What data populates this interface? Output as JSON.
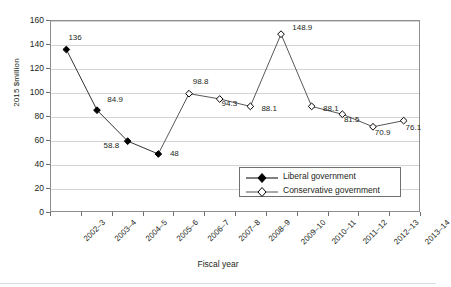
{
  "chart_data": {
    "type": "line",
    "title": "",
    "xlabel": "Fiscal year",
    "ylabel": "2015 $million",
    "categories": [
      "2002–3",
      "2003–4",
      "2004–5",
      "2005–6",
      "2006–7",
      "2007–8",
      "2008–9",
      "2009–10",
      "2010–11",
      "2011–12",
      "2012–13",
      "2013–14"
    ],
    "ylim": [
      0,
      160
    ],
    "yticks": [
      0,
      20,
      40,
      60,
      80,
      100,
      120,
      140,
      160
    ],
    "ytick_labels": [
      "0",
      "20",
      "40",
      "60",
      "80",
      "100",
      "120",
      "140",
      "160"
    ],
    "grid": "horizontal",
    "legend_position": "inside-lower-right",
    "series": [
      {
        "name": "Liberal government",
        "marker": "filled-diamond",
        "color": "#000000",
        "values": [
          136,
          84.9,
          58.8,
          48,
          null,
          null,
          null,
          null,
          null,
          null,
          null,
          null
        ],
        "point_labels": [
          "136",
          "84.9",
          "58.8",
          "48",
          "",
          "",
          "",
          "",
          "",
          "",
          "",
          ""
        ]
      },
      {
        "name": "Conservative government",
        "marker": "open-diamond",
        "color": "#000000",
        "values": [
          null,
          null,
          null,
          null,
          98.8,
          94.3,
          88.1,
          148.9,
          88.1,
          81.5,
          70.9,
          76.1
        ],
        "point_labels": [
          "",
          "",
          "",
          "",
          "98.8",
          "94.3",
          "88.1",
          "148.9",
          "88.1",
          "81.5",
          "70.9",
          "76.1"
        ]
      }
    ]
  },
  "legend": {
    "items": [
      {
        "label": "Liberal government",
        "marker": "filled-diamond"
      },
      {
        "label": "Conservative government",
        "marker": "open-diamond"
      }
    ]
  },
  "axes": {
    "y_title": "2015 $million",
    "x_title": "Fiscal year"
  }
}
